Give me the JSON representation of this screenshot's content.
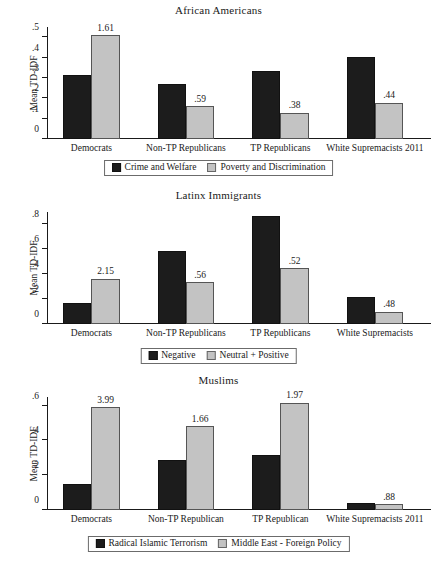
{
  "figure": {
    "ylabel": "Mean TD-IDF"
  },
  "chart_data": [
    {
      "type": "bar",
      "title": "African Americans",
      "xlabel": "",
      "ylabel": "Mean TD-IDF",
      "ylim": [
        0,
        0.55
      ],
      "yticks": [
        "0",
        ".1",
        ".2",
        ".3",
        ".4",
        ".5"
      ],
      "ytick_values": [
        0,
        0.1,
        0.2,
        0.3,
        0.4,
        0.5
      ],
      "grid": false,
      "legend_position": "below",
      "categories": [
        "Democrats",
        "Non-TP Republicans",
        "TP Republicans",
        "White Supremacists 2011"
      ],
      "series": [
        {
          "name": "Crime and Welfare",
          "color": "#1c1c1c",
          "values": [
            0.315,
            0.272,
            0.332,
            0.404
          ]
        },
        {
          "name": "Poverty and Discrimination",
          "color": "#c3c3c3",
          "values": [
            0.51,
            0.162,
            0.128,
            0.178
          ]
        }
      ],
      "annotations": [
        "1.61",
        ".59",
        ".38",
        ".44"
      ]
    },
    {
      "type": "bar",
      "title": "Latinx Immigrants",
      "xlabel": "",
      "ylabel": "Mean TD-IDF",
      "ylim": [
        0,
        0.9
      ],
      "yticks": [
        "0",
        ".2",
        ".4",
        ".6",
        ".8"
      ],
      "ytick_values": [
        0,
        0.2,
        0.4,
        0.6,
        0.8
      ],
      "grid": false,
      "legend_position": "below",
      "categories": [
        "Democrats",
        "Non-TP Republicans",
        "TP Republicans",
        "White Supremacists"
      ],
      "series": [
        {
          "name": "Negative",
          "color": "#1c1c1c",
          "values": [
            0.17,
            0.59,
            0.87,
            0.215
          ]
        },
        {
          "name": "Neutral + Positive",
          "color": "#c3c3c3",
          "values": [
            0.365,
            0.335,
            0.45,
            0.1
          ]
        }
      ],
      "annotations": [
        "2.15",
        ".56",
        ".52",
        ".48"
      ]
    },
    {
      "type": "bar",
      "title": "Muslims",
      "xlabel": "",
      "ylabel": "Mean TD-IDF",
      "ylim": [
        0,
        0.65
      ],
      "yticks": [
        "0",
        ".2",
        ".4",
        ".6"
      ],
      "ytick_values": [
        0,
        0.2,
        0.4,
        0.6
      ],
      "grid": false,
      "legend_position": "below",
      "categories": [
        "Democrats",
        "Non-TP Republican",
        "TP Republican",
        "White Supremacists 2011"
      ],
      "series": [
        {
          "name": "Radical Islamic Terrorism",
          "color": "#1c1c1c",
          "values": [
            0.148,
            0.29,
            0.315,
            0.04
          ]
        },
        {
          "name": "Middle East - Foreign Policy",
          "color": "#c3c3c3",
          "values": [
            0.592,
            0.482,
            0.617,
            0.032
          ]
        }
      ],
      "annotations": [
        "3.99",
        "1.66",
        "1.97",
        ".88"
      ]
    }
  ]
}
